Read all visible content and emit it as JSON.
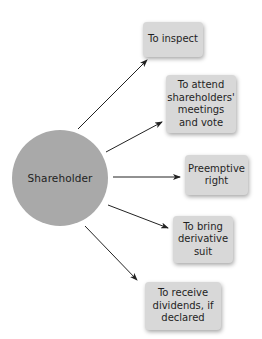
{
  "diagram": {
    "hub": {
      "label": "Shareholder",
      "color": "#a9a9a9"
    },
    "rights": [
      {
        "label": "To inspect"
      },
      {
        "label": "To attend shareholders' meetings and vote"
      },
      {
        "label": "Preemptive right"
      },
      {
        "label": "To bring derivative suit"
      },
      {
        "label": "To receive dividends, if declared"
      }
    ],
    "box_color": "#d8d8d8",
    "arrow_color": "#222222"
  }
}
